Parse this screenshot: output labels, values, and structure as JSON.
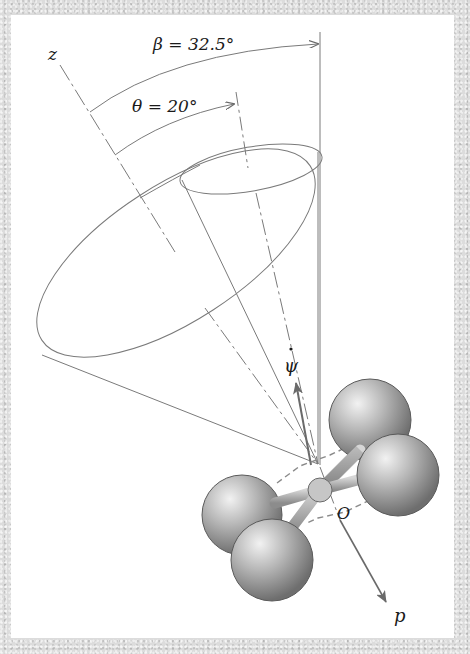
{
  "figure": {
    "labels": {
      "z_axis": "z",
      "p_axis": "p",
      "origin": "O",
      "psi_dot": "ψ",
      "beta": "β = 32.5°",
      "theta": "θ = 20°"
    },
    "angles": {
      "beta_deg": 32.5,
      "theta_deg": 20
    },
    "colors": {
      "background_texture": "#dcdcdc",
      "panel": "#ffffff",
      "line": "#7a7a7a",
      "sphere": "#9a9a9a",
      "text": "#1a1a1a"
    }
  }
}
